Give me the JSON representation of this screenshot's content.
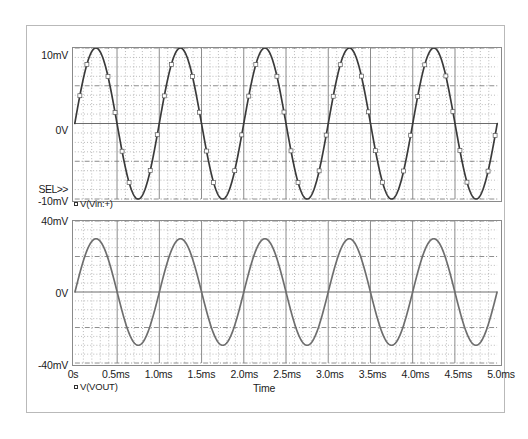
{
  "app": {
    "name": "PSpice Probe Waveform Viewer",
    "selection_marker": "SEL>>"
  },
  "axis": {
    "x_title": "Time",
    "x_ticks": [
      "0s",
      "0.5ms",
      "1.0ms",
      "1.5ms",
      "2.0ms",
      "2.5ms",
      "3.0ms",
      "3.5ms",
      "4.0ms",
      "4.5ms",
      "5.0ms"
    ]
  },
  "panels": [
    {
      "id": "top",
      "trace_label": "V(Vin:+)",
      "y_ticks": [
        "10mV",
        "0V",
        "-10mV"
      ],
      "trace_color": "#3a3a3a"
    },
    {
      "id": "bottom",
      "trace_label": "V(VOUT)",
      "y_ticks": [
        "40mV",
        "0V",
        "-40mV"
      ],
      "trace_color": "#6e6e6e"
    }
  ],
  "chart_data": [
    {
      "type": "line",
      "title": "",
      "xlabel": "Time",
      "ylabel": "",
      "xlim": [
        0,
        5
      ],
      "ylim": [
        -10,
        10
      ],
      "x_unit": "ms",
      "y_unit": "mV",
      "grid": true,
      "x_major_step": 0.5,
      "x_minor_divisions": 5,
      "y_major_step": 5,
      "y_minor_step": 1.25,
      "legend": [
        "V(Vin:+)"
      ],
      "legend_position": "below-axis-left",
      "series": [
        {
          "name": "V(Vin:+)",
          "waveform": "sine",
          "amplitude": 10,
          "offset": 0,
          "frequency_khz": 1,
          "phase_deg": 0,
          "cycles": 5,
          "color": "#3a3a3a"
        }
      ],
      "x": [
        0,
        0.25,
        0.5,
        0.75,
        1.0,
        1.25,
        1.5,
        1.75,
        2.0,
        2.25,
        2.5,
        2.75,
        3.0,
        3.25,
        3.5,
        3.75,
        4.0,
        4.25,
        4.5,
        4.75,
        5.0
      ],
      "values": [
        0,
        10,
        0,
        -10,
        0,
        10,
        0,
        -10,
        0,
        10,
        0,
        -10,
        0,
        10,
        0,
        -10,
        0,
        10,
        0,
        -10,
        0
      ]
    },
    {
      "type": "line",
      "title": "",
      "xlabel": "Time",
      "ylabel": "",
      "xlim": [
        0,
        5
      ],
      "ylim": [
        -40,
        40
      ],
      "x_unit": "ms",
      "y_unit": "mV",
      "grid": true,
      "x_major_step": 0.5,
      "x_minor_divisions": 5,
      "y_major_step": 20,
      "y_minor_step": 5,
      "legend": [
        "V(VOUT)"
      ],
      "legend_position": "below-axis-left",
      "series": [
        {
          "name": "V(VOUT)",
          "waveform": "sine",
          "amplitude": 30,
          "offset": 0,
          "frequency_khz": 1,
          "phase_deg": 0,
          "cycles": 5,
          "color": "#6e6e6e"
        }
      ],
      "x": [
        0,
        0.25,
        0.5,
        0.75,
        1.0,
        1.25,
        1.5,
        1.75,
        2.0,
        2.25,
        2.5,
        2.75,
        3.0,
        3.25,
        3.5,
        3.75,
        4.0,
        4.25,
        4.5,
        4.75,
        5.0
      ],
      "values": [
        0,
        30,
        0,
        -30,
        0,
        30,
        0,
        -30,
        0,
        30,
        0,
        -30,
        0,
        30,
        0,
        -30,
        0,
        30,
        0,
        -30,
        0
      ]
    }
  ]
}
